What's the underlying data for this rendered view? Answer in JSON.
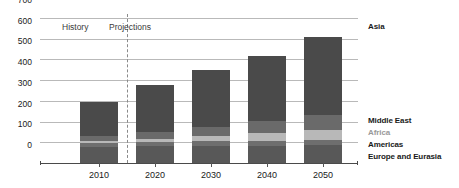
{
  "chart_data": {
    "type": "bar",
    "stacked": true,
    "title": "",
    "subtitle": "",
    "xlabel": "",
    "ylabel": "",
    "categories": [
      "2010",
      "2020",
      "2030",
      "2040",
      "2050"
    ],
    "ylim": [
      0,
      700
    ],
    "yticks": [
      0,
      100,
      200,
      300,
      400,
      500,
      600,
      700
    ],
    "ytick_labels": [
      "0",
      "100",
      "200",
      "300",
      "400",
      "500",
      "600",
      "700"
    ],
    "grid": true,
    "legend_position": "right-inline",
    "series": [
      {
        "name": "Europe and Eurasia",
        "color": "#585858",
        "values": [
          78,
          80,
          82,
          84,
          86
        ]
      },
      {
        "name": "Americas",
        "color": "#6e6e6e",
        "values": [
          18,
          20,
          22,
          24,
          26
        ]
      },
      {
        "name": "Africa",
        "color": "#b8b8b8",
        "values": [
          12,
          18,
          26,
          36,
          48
        ]
      },
      {
        "name": "Middle East",
        "color": "#6a6a6a",
        "values": [
          22,
          32,
          45,
          58,
          72
        ]
      },
      {
        "name": "Asia",
        "color": "#4a4a4a",
        "values": [
          165,
          225,
          275,
          313,
          378
        ]
      }
    ],
    "totals": [
      295,
      375,
      450,
      515,
      610
    ],
    "annotations": [
      {
        "name": "history-label",
        "text": "History"
      },
      {
        "name": "projections-label",
        "text": "Projections"
      },
      {
        "name": "asia-label",
        "text": "Asia"
      }
    ],
    "divider": {
      "between": [
        "2010",
        "2020"
      ],
      "style": "dashed"
    },
    "colors": {
      "gridline": "#b9b9b9",
      "axis": "#4a4a4a",
      "text": "#1a1a1a",
      "africa_label": "#9a9a9a"
    }
  },
  "right_labels": [
    {
      "text": "Asia"
    },
    {
      "text": "Middle East"
    },
    {
      "text": "Africa"
    },
    {
      "text": "Americas"
    },
    {
      "text": "Europe and Eurasia"
    }
  ],
  "phases": {
    "history": "History",
    "projections": "Projections"
  }
}
